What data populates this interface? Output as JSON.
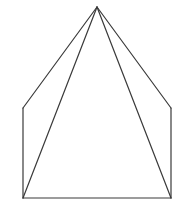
{
  "figure": {
    "stroke_color": "#3a3a3a",
    "background": "#ffffff",
    "vertices": {
      "apex": [
        97,
        7
      ],
      "upper_left": [
        23,
        108
      ],
      "lower_left": [
        23,
        198
      ],
      "lower_right": [
        171,
        198
      ],
      "upper_right": [
        171,
        108
      ]
    },
    "edges": [
      [
        "apex",
        "upper_left"
      ],
      [
        "upper_left",
        "lower_left"
      ],
      [
        "lower_left",
        "lower_right"
      ],
      [
        "lower_right",
        "upper_right"
      ],
      [
        "upper_right",
        "apex"
      ]
    ],
    "diagonals": [
      [
        "apex",
        "lower_left"
      ],
      [
        "apex",
        "lower_right"
      ]
    ]
  }
}
